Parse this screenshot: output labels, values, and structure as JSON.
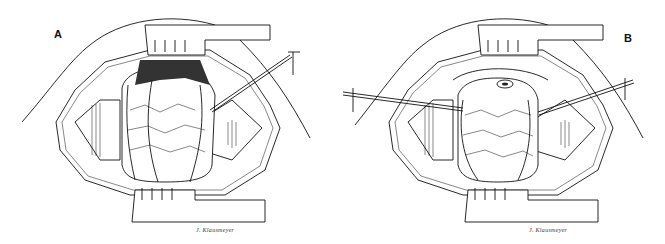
{
  "figure": {
    "panels": [
      {
        "id": "A",
        "label": "A",
        "signature": "J. Klausmeyer"
      },
      {
        "id": "B",
        "label": "B",
        "signature": "J. Klausmeyer"
      }
    ]
  }
}
